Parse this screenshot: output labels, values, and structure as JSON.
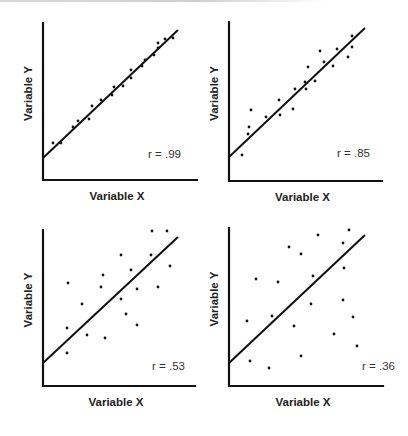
{
  "chart_data": [
    {
      "type": "scatter",
      "title": "",
      "xlabel": "Variable X",
      "ylabel": "Variable Y",
      "annotation": "r = .99",
      "r": 0.99,
      "grid": false,
      "legend": "none",
      "axes_px": {
        "x0": 43,
        "y0": 180,
        "x1": 197,
        "ytop": 23
      },
      "fit_line_px": [
        [
          43,
          158
        ],
        [
          178,
          30
        ]
      ],
      "points_px": [
        [
          53,
          143
        ],
        [
          61,
          143
        ],
        [
          73,
          127
        ],
        [
          78,
          121
        ],
        [
          89,
          119
        ],
        [
          92,
          106
        ],
        [
          101,
          100
        ],
        [
          112,
          95
        ],
        [
          114,
          87
        ],
        [
          123,
          86
        ],
        [
          131,
          70
        ],
        [
          131,
          78
        ],
        [
          142,
          66
        ],
        [
          145,
          60
        ],
        [
          154,
          55
        ],
        [
          158,
          43
        ],
        [
          158,
          48
        ],
        [
          165,
          39
        ],
        [
          173,
          38
        ]
      ],
      "label_px": {
        "r": [
          148,
          158
        ]
      }
    },
    {
      "type": "scatter",
      "title": "",
      "xlabel": "Variable X",
      "ylabel": "Variable Y",
      "annotation": "r = .85",
      "r": 0.85,
      "grid": false,
      "legend": "none",
      "axes_px": {
        "x0": 229,
        "y0": 181,
        "x1": 382,
        "ytop": 22
      },
      "fit_line_px": [
        [
          229,
          157
        ],
        [
          365,
          28
        ]
      ],
      "points_px": [
        [
          242,
          155
        ],
        [
          248,
          134
        ],
        [
          249,
          127
        ],
        [
          251,
          110
        ],
        [
          266,
          117
        ],
        [
          279,
          100
        ],
        [
          280,
          115
        ],
        [
          293,
          109
        ],
        [
          295,
          89
        ],
        [
          305,
          82
        ],
        [
          306,
          89
        ],
        [
          308,
          67
        ],
        [
          315,
          81
        ],
        [
          320,
          51
        ],
        [
          324,
          62
        ],
        [
          333,
          66
        ],
        [
          337,
          49
        ],
        [
          348,
          57
        ],
        [
          352,
          47
        ],
        [
          352,
          36
        ]
      ],
      "label_px": {
        "r": [
          337,
          157
        ]
      }
    },
    {
      "type": "scatter",
      "title": "",
      "xlabel": "Variable X",
      "ylabel": "Variable Y",
      "annotation": "r = .53",
      "r": 0.53,
      "grid": false,
      "legend": "none",
      "axes_px": {
        "x0": 43,
        "y0": 386,
        "x1": 195,
        "ytop": 230
      },
      "fit_line_px": [
        [
          43,
          363
        ],
        [
          178,
          237
        ]
      ],
      "points_px": [
        [
          152,
          231
        ],
        [
          167,
          231
        ],
        [
          121,
          255
        ],
        [
          151,
          255
        ],
        [
          170,
          266
        ],
        [
          103,
          275
        ],
        [
          131,
          270
        ],
        [
          68,
          283
        ],
        [
          101,
          287
        ],
        [
          137,
          289
        ],
        [
          158,
          287
        ],
        [
          121,
          299
        ],
        [
          82,
          304
        ],
        [
          126,
          314
        ],
        [
          67,
          328
        ],
        [
          137,
          325
        ],
        [
          87,
          335
        ],
        [
          105,
          338
        ],
        [
          67,
          353
        ]
      ],
      "label_px": {
        "r": [
          152,
          370
        ]
      }
    },
    {
      "type": "scatter",
      "title": "",
      "xlabel": "Variable X",
      "ylabel": "Variable Y",
      "annotation": "r = .36",
      "r": 0.36,
      "grid": false,
      "legend": "none",
      "axes_px": {
        "x0": 229,
        "y0": 386,
        "x1": 383,
        "ytop": 228
      },
      "fit_line_px": [
        [
          229,
          363
        ],
        [
          365,
          235
        ]
      ],
      "points_px": [
        [
          349,
          230
        ],
        [
          318,
          235
        ],
        [
          343,
          243
        ],
        [
          289,
          247
        ],
        [
          301,
          254
        ],
        [
          344,
          268
        ],
        [
          313,
          276
        ],
        [
          256,
          279
        ],
        [
          278,
          282
        ],
        [
          343,
          300
        ],
        [
          311,
          304
        ],
        [
          353,
          317
        ],
        [
          247,
          321
        ],
        [
          272,
          316
        ],
        [
          294,
          326
        ],
        [
          334,
          334
        ],
        [
          357,
          346
        ],
        [
          301,
          356
        ],
        [
          250,
          361
        ],
        [
          269,
          368
        ]
      ],
      "label_px": {
        "r": [
          362,
          370
        ]
      }
    }
  ],
  "panels": [
    {
      "xlabel": "Variable X",
      "ylabel": "Variable Y",
      "r_text": "r = .99"
    },
    {
      "xlabel": "Variable X",
      "ylabel": "Variable Y",
      "r_text": "r = .85"
    },
    {
      "xlabel": "Variable X",
      "ylabel": "Variable Y",
      "r_text": "r = .53"
    },
    {
      "xlabel": "Variable X",
      "ylabel": "Variable Y",
      "r_text": "r = .36"
    }
  ],
  "colors": {
    "ink": "#111111",
    "background": "#ffffff"
  }
}
